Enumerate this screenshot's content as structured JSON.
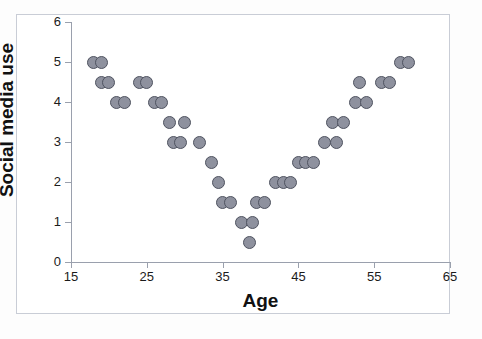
{
  "chart_data": {
    "type": "scatter",
    "title": "",
    "xlabel": "Age",
    "ylabel": "Social media use",
    "xlim": [
      15,
      65
    ],
    "ylim": [
      0,
      6
    ],
    "xticks": [
      15,
      25,
      35,
      45,
      55,
      65
    ],
    "yticks": [
      0,
      1,
      2,
      3,
      4,
      5,
      6
    ],
    "grid": false,
    "legend": null,
    "marker": {
      "shape": "circle",
      "fill_color": "#8e919e",
      "edge_color": "#4f5360",
      "size_px": 13
    },
    "series": [
      {
        "name": "respondents",
        "points": [
          {
            "x": 18.0,
            "y": 5.0
          },
          {
            "x": 19.0,
            "y": 5.0
          },
          {
            "x": 19.0,
            "y": 4.5
          },
          {
            "x": 20.0,
            "y": 4.5
          },
          {
            "x": 21.0,
            "y": 4.0
          },
          {
            "x": 22.0,
            "y": 4.0
          },
          {
            "x": 24.0,
            "y": 4.5
          },
          {
            "x": 25.0,
            "y": 4.5
          },
          {
            "x": 26.0,
            "y": 4.0
          },
          {
            "x": 27.0,
            "y": 4.0
          },
          {
            "x": 28.0,
            "y": 3.5
          },
          {
            "x": 30.0,
            "y": 3.5
          },
          {
            "x": 28.5,
            "y": 3.0
          },
          {
            "x": 29.5,
            "y": 3.0
          },
          {
            "x": 32.0,
            "y": 3.0
          },
          {
            "x": 33.5,
            "y": 2.5
          },
          {
            "x": 34.5,
            "y": 2.0
          },
          {
            "x": 35.0,
            "y": 1.5
          },
          {
            "x": 36.0,
            "y": 1.5
          },
          {
            "x": 37.5,
            "y": 1.0
          },
          {
            "x": 39.0,
            "y": 1.0
          },
          {
            "x": 38.5,
            "y": 0.5
          },
          {
            "x": 39.5,
            "y": 1.5
          },
          {
            "x": 40.5,
            "y": 1.5
          },
          {
            "x": 42.0,
            "y": 2.0
          },
          {
            "x": 43.0,
            "y": 2.0
          },
          {
            "x": 44.0,
            "y": 2.0
          },
          {
            "x": 45.0,
            "y": 2.5
          },
          {
            "x": 46.0,
            "y": 2.5
          },
          {
            "x": 47.0,
            "y": 2.5
          },
          {
            "x": 48.5,
            "y": 3.0
          },
          {
            "x": 50.0,
            "y": 3.0
          },
          {
            "x": 49.5,
            "y": 3.5
          },
          {
            "x": 51.0,
            "y": 3.5
          },
          {
            "x": 52.5,
            "y": 4.0
          },
          {
            "x": 54.0,
            "y": 4.0
          },
          {
            "x": 53.0,
            "y": 4.5
          },
          {
            "x": 56.0,
            "y": 4.5
          },
          {
            "x": 57.0,
            "y": 4.5
          },
          {
            "x": 58.5,
            "y": 5.0
          },
          {
            "x": 59.5,
            "y": 5.0
          }
        ]
      }
    ]
  }
}
